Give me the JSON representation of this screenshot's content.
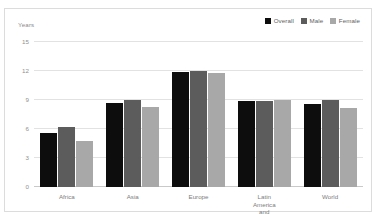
{
  "chart_data": {
    "type": "bar",
    "title": "",
    "subtitle": "",
    "xlabel": "",
    "ylabel": "Years",
    "ylim": [
      0,
      15
    ],
    "yticks": [
      "0",
      "3",
      "6",
      "9",
      "12",
      "15"
    ],
    "grid": true,
    "legend_position": "top-right",
    "categories": [
      "Africa",
      "Asia",
      "Europe",
      "Latin America\nand Caribbean",
      "World"
    ],
    "series": [
      {
        "name": "Overall",
        "color": "#0d0d0d",
        "values": [
          5.6,
          8.7,
          11.9,
          8.9,
          8.6
        ]
      },
      {
        "name": "Male",
        "color": "#5c5c5c",
        "values": [
          6.2,
          9.0,
          12.0,
          8.9,
          9.0
        ]
      },
      {
        "name": "Female",
        "color": "#a8a8a8",
        "values": [
          4.8,
          8.3,
          11.8,
          9.0,
          8.2
        ]
      }
    ]
  },
  "axis": {
    "y_title": "Years"
  },
  "legend": {
    "items": [
      {
        "label": "Overall",
        "swatch": "legend-swatch-overall",
        "color": "#0d0d0d"
      },
      {
        "label": "Male",
        "swatch": "legend-swatch-male",
        "color": "#5c5c5c"
      },
      {
        "label": "Female",
        "swatch": "legend-swatch-female",
        "color": "#a8a8a8"
      }
    ]
  },
  "colors": {
    "background": "#ffffff",
    "gridline": "#e2e2e2",
    "baseline": "#c9c9c9",
    "border": "#dcdcdc",
    "tick_text": "#8f8f8f",
    "label_text": "#7d7d7d"
  }
}
